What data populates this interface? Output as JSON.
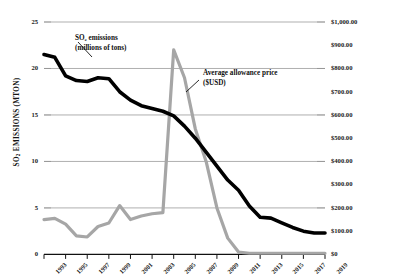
{
  "chart_data": {
    "type": "line",
    "title": "",
    "xlabel": "",
    "x": [
      1993,
      1994,
      1995,
      1996,
      1997,
      1998,
      1999,
      2000,
      2001,
      2002,
      2003,
      2004,
      2005,
      2006,
      2007,
      2008,
      2009,
      2010,
      2011,
      2012,
      2013,
      2014,
      2015,
      2016,
      2017,
      2018,
      2019
    ],
    "grid": true,
    "legend_position": "inline-annotations",
    "axes": {
      "left": {
        "label": "SO2 EMISSIONS (MTON)",
        "label_display": "SO₂ EMISSIONS (MTON)",
        "ticks": [
          "0",
          "5",
          "10",
          "15",
          "20",
          "25"
        ],
        "tick_values": [
          0,
          5,
          10,
          15,
          20,
          25
        ],
        "range": [
          0,
          25
        ]
      },
      "right": {
        "label": "AVERAGE WINNING SO2 ALLOWANCE BID ($USD)",
        "label_display": "AVERAGE WINNING SO₂ ALLOWANCE BID ($USD)",
        "ticks": [
          "$0",
          "$100.00",
          "$200.00",
          "$300.00",
          "$400.00",
          "$500.00",
          "$600.00",
          "$700.00",
          "$800.00",
          "$900.00",
          "$1,000.00"
        ],
        "tick_values": [
          0,
          100,
          200,
          300,
          400,
          500,
          600,
          700,
          800,
          900,
          1000
        ],
        "range": [
          0,
          1000
        ]
      },
      "bottom": {
        "ticks": [
          "1993",
          "1995",
          "1997",
          "1999",
          "2001",
          "2003",
          "2005",
          "2007",
          "2009",
          "2011",
          "2013",
          "2015",
          "2017",
          "2019"
        ],
        "tick_values": [
          1993,
          1995,
          1997,
          1999,
          2001,
          2003,
          2005,
          2007,
          2009,
          2011,
          2013,
          2015,
          2017,
          2019
        ]
      }
    },
    "series": [
      {
        "name": "SO2 emissions (millions of tons)",
        "axis": "left",
        "unit": "MTON",
        "color": "#000000",
        "values": [
          21.5,
          21.2,
          19.2,
          18.7,
          18.6,
          19.0,
          18.9,
          17.5,
          16.6,
          16.0,
          15.7,
          15.4,
          14.9,
          13.8,
          12.5,
          11.0,
          9.5,
          8.0,
          6.9,
          5.2,
          4.0,
          3.9,
          3.4,
          2.9,
          2.5,
          2.3,
          2.3
        ]
      },
      {
        "name": "Average allowance price ($USD)",
        "axis": "right",
        "unit": "USD",
        "color": "#a6a6a6",
        "values": [
          150,
          155,
          130,
          80,
          75,
          120,
          135,
          210,
          150,
          165,
          175,
          180,
          880,
          760,
          540,
          400,
          200,
          70,
          10,
          5,
          5,
          5,
          5,
          5,
          5,
          5,
          5
        ]
      }
    ],
    "annotations": [
      {
        "id": "emissions-annotation",
        "line1": "SO₂ emissions",
        "line2": "(millions of tons)",
        "target_series": "SO2 emissions (millions of tons)"
      },
      {
        "id": "price-annotation",
        "line1": "Average allowance price",
        "line2": "($USD)",
        "target_series": "Average allowance price ($USD)"
      }
    ]
  }
}
